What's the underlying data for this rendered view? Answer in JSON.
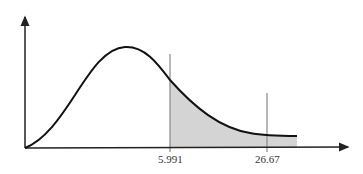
{
  "diagram": {
    "type": "chi-square distribution curve with shaded right-tail region",
    "markers": [
      {
        "label": "5.991",
        "role": "critical value"
      },
      {
        "label": "26.67",
        "role": "test statistic"
      }
    ],
    "shaded_region": "area under curve right of 5.991",
    "colors": {
      "curve": "#111111",
      "axis": "#222222",
      "marker_line": "#888888",
      "shade": "#d4d4d4"
    }
  }
}
